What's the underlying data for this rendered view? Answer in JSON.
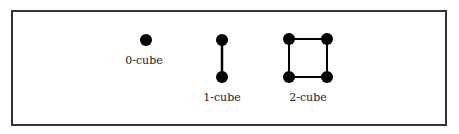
{
  "diagram": {
    "cubes": [
      {
        "label": "0-cube",
        "vertices": [
          [
            146,
            40
          ]
        ],
        "edges": []
      },
      {
        "label": "1-cube",
        "vertices": [
          [
            222,
            40
          ],
          [
            222,
            77
          ]
        ],
        "edges": [
          [
            0,
            1
          ]
        ]
      },
      {
        "label": "2-cube",
        "vertices": [
          [
            289,
            39
          ],
          [
            327,
            39
          ],
          [
            327,
            77
          ],
          [
            289,
            77
          ]
        ],
        "edges": [
          [
            0,
            1
          ],
          [
            1,
            2
          ],
          [
            2,
            3
          ],
          [
            3,
            0
          ]
        ]
      }
    ],
    "colors": {
      "vertex": "#000000",
      "edge": "#000000",
      "border": "#333333"
    }
  }
}
